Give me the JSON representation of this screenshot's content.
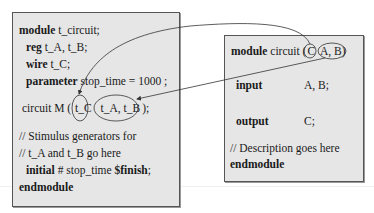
{
  "left_module": {
    "lines": [
      {
        "kw": "module",
        "text": " t_circuit;"
      },
      {
        "kw": "reg",
        "text": " t_A, t_B;"
      },
      {
        "kw": "wire",
        "text": " t_C;"
      },
      {
        "kw": "parameter",
        "text": " stop_time  =  1000 ;"
      },
      {
        "kw": "",
        "text": "circuit M ( t_C  t_A, t_B );"
      },
      {
        "kw": "",
        "text": "// Stimulus generators for"
      },
      {
        "kw": "",
        "text": "// t_A and t_B go here"
      },
      {
        "kw": "initial",
        "text": " # stop_time ",
        "kw2": "$finish",
        "tail": ";"
      },
      {
        "kw": "endmodule",
        "text": ""
      }
    ],
    "instance_prefix": "circuit M (",
    "instance_c": "t_C",
    "instance_ab": "t_A, t_B",
    "instance_suffix": ");"
  },
  "right_module": {
    "header_kw": "module",
    "header_text": " circuit (",
    "port_c": "C",
    "port_ab": "A, B",
    "header_close": ")",
    "input_kw": "input",
    "input_val": "A, B;",
    "output_kw": "output",
    "output_val": "C;",
    "comment": "// Description goes here",
    "end_kw": "endmodule"
  },
  "connections": [
    {
      "from": "C",
      "to": "t_C"
    },
    {
      "from": "A, B",
      "to": "t_A, t_B"
    }
  ],
  "colors": {
    "box_fill": "#e6e6e6",
    "box_border": "#555555",
    "line": "#333333"
  }
}
